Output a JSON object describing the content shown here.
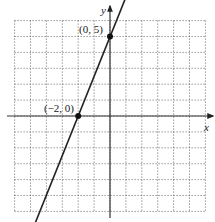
{
  "chart_data": {
    "type": "line",
    "title": "",
    "xlabel": "x",
    "ylabel": "y",
    "xlim": [
      -6,
      6
    ],
    "ylim": [
      -6,
      6
    ],
    "grid": true,
    "grid_style": "dotted",
    "series": [
      {
        "name": "line",
        "equation": "y = 2.5x + 5",
        "x": [
          -5,
          1.3
        ],
        "y": [
          -7.5,
          8.25
        ],
        "arrows": "both"
      }
    ],
    "points": [
      {
        "x": 0,
        "y": 5,
        "label": "(0, 5)"
      },
      {
        "x": -2,
        "y": 0,
        "label": "(−2, 0)"
      }
    ]
  },
  "labels": {
    "x_axis": "x",
    "y_axis": "y",
    "point_a": "(0, 5)",
    "point_b": "(−2, 0)"
  },
  "colors": {
    "axis": "#333333",
    "grid": "#555555",
    "line": "#222222"
  }
}
